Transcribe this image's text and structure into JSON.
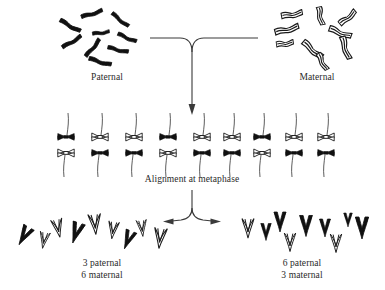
{
  "figure": {
    "title_visible": false,
    "background_color": "#ffffff",
    "ink_color": "#111111",
    "text_color": "#2a2a2a"
  },
  "labels": {
    "paternal": "Paternal",
    "maternal": "Maternal",
    "metaphase": "Alignment at metaphase",
    "daughter_left": "3 paternal\n6 maternal",
    "daughter_right": "6 paternal\n3 maternal"
  },
  "legend_semantics": {
    "solid_black": "paternal chromosome",
    "outlined_white": "maternal chromosome"
  },
  "chart_data": {
    "type": "diagram",
    "chromosome_pairs_total": 9,
    "parent_clusters": [
      {
        "name": "Paternal",
        "origin": "paternal",
        "style": "solid",
        "count": 9,
        "chromosomes": [
          {
            "cx": 92,
            "cy": 14,
            "angle": -18,
            "len": 22,
            "w": 5.2
          },
          {
            "cx": 120,
            "cy": 20,
            "angle": 38,
            "len": 21,
            "w": 5.0
          },
          {
            "cx": 70,
            "cy": 26,
            "angle": 28,
            "len": 23,
            "w": 5.4
          },
          {
            "cx": 101,
            "cy": 33,
            "angle": -8,
            "len": 17,
            "w": 4.6
          },
          {
            "cx": 127,
            "cy": 38,
            "angle": 22,
            "len": 20,
            "w": 5.0
          },
          {
            "cx": 72,
            "cy": 42,
            "angle": -32,
            "len": 22,
            "w": 5.2
          },
          {
            "cx": 93,
            "cy": 48,
            "angle": -52,
            "len": 22,
            "w": 5.2
          },
          {
            "cx": 118,
            "cy": 50,
            "angle": 12,
            "len": 21,
            "w": 5.0
          },
          {
            "cx": 100,
            "cy": 62,
            "angle": 15,
            "len": 23,
            "w": 5.4
          }
        ]
      },
      {
        "name": "Maternal",
        "origin": "maternal",
        "style": "outline",
        "count": 9,
        "chromosomes": [
          {
            "cx": 292,
            "cy": 15,
            "angle": -10,
            "len": 21,
            "w": 6.0
          },
          {
            "cx": 320,
            "cy": 16,
            "angle": 78,
            "len": 18,
            "w": 5.6
          },
          {
            "cx": 348,
            "cy": 18,
            "angle": -40,
            "len": 20,
            "w": 5.8
          },
          {
            "cx": 287,
            "cy": 30,
            "angle": -15,
            "len": 24,
            "w": 6.2
          },
          {
            "cx": 340,
            "cy": 33,
            "angle": 20,
            "len": 23,
            "w": 6.0
          },
          {
            "cx": 285,
            "cy": 44,
            "angle": -8,
            "len": 17,
            "w": 5.4
          },
          {
            "cx": 312,
            "cy": 50,
            "angle": 40,
            "len": 24,
            "w": 6.2
          },
          {
            "cx": 345,
            "cy": 48,
            "angle": 72,
            "len": 23,
            "w": 6.0
          },
          {
            "cx": 322,
            "cy": 62,
            "angle": 62,
            "len": 18,
            "w": 5.6
          }
        ]
      }
    ],
    "metaphase_plate": {
      "label": "Alignment at metaphase",
      "pair_count": 9,
      "note": "Each bivalent has one paternal and one maternal homolog; which side faces up is random.",
      "pairs": [
        {
          "index": 1,
          "x": 66,
          "top": "paternal",
          "bottom": "maternal"
        },
        {
          "index": 2,
          "x": 100,
          "top": "maternal",
          "bottom": "paternal"
        },
        {
          "index": 3,
          "x": 134,
          "top": "maternal",
          "bottom": "paternal"
        },
        {
          "index": 4,
          "x": 168,
          "top": "paternal",
          "bottom": "maternal"
        },
        {
          "index": 5,
          "x": 202,
          "top": "maternal",
          "bottom": "paternal"
        },
        {
          "index": 6,
          "x": 232,
          "top": "maternal",
          "bottom": "paternal"
        },
        {
          "index": 7,
          "x": 262,
          "top": "paternal",
          "bottom": "maternal"
        },
        {
          "index": 8,
          "x": 294,
          "top": "maternal",
          "bottom": "paternal"
        },
        {
          "index": 9,
          "x": 326,
          "top": "maternal",
          "bottom": "paternal"
        }
      ],
      "top_row_counts": {
        "paternal": 3,
        "maternal": 6
      },
      "bottom_row_counts": {
        "paternal": 6,
        "maternal": 3
      }
    },
    "daughter_cells": [
      {
        "side": "left",
        "label": "3 paternal\n6 maternal",
        "paternal_count": 3,
        "maternal_count": 6,
        "total": 9,
        "chromosomes": [
          {
            "cx": 24,
            "cy": 236,
            "angle": 30,
            "len": 20,
            "style": "solid"
          },
          {
            "cx": 44,
            "cy": 240,
            "angle": 10,
            "len": 16,
            "style": "outline"
          },
          {
            "cx": 58,
            "cy": 228,
            "angle": -12,
            "len": 18,
            "style": "outline"
          },
          {
            "cx": 76,
            "cy": 233,
            "angle": 18,
            "len": 21,
            "style": "solid"
          },
          {
            "cx": 95,
            "cy": 224,
            "angle": -5,
            "len": 20,
            "style": "outline"
          },
          {
            "cx": 113,
            "cy": 230,
            "angle": 8,
            "len": 17,
            "style": "outline"
          },
          {
            "cx": 128,
            "cy": 240,
            "angle": 22,
            "len": 19,
            "style": "solid"
          },
          {
            "cx": 142,
            "cy": 228,
            "angle": -6,
            "len": 16,
            "style": "outline"
          },
          {
            "cx": 160,
            "cy": 238,
            "angle": 6,
            "len": 20,
            "style": "outline"
          }
        ]
      },
      {
        "side": "right",
        "label": "6 paternal\n3 maternal",
        "paternal_count": 6,
        "maternal_count": 3,
        "total": 9,
        "chromosomes": [
          {
            "cx": 248,
            "cy": 228,
            "angle": 0,
            "len": 19,
            "style": "outline"
          },
          {
            "cx": 266,
            "cy": 232,
            "angle": 0,
            "len": 17,
            "style": "solid"
          },
          {
            "cx": 280,
            "cy": 222,
            "angle": 0,
            "len": 20,
            "style": "solid"
          },
          {
            "cx": 290,
            "cy": 242,
            "angle": 0,
            "len": 18,
            "style": "outline"
          },
          {
            "cx": 306,
            "cy": 226,
            "angle": 0,
            "len": 21,
            "style": "solid"
          },
          {
            "cx": 325,
            "cy": 228,
            "angle": 0,
            "len": 18,
            "style": "solid"
          },
          {
            "cx": 336,
            "cy": 243,
            "angle": 0,
            "len": 18,
            "style": "outline"
          },
          {
            "cx": 348,
            "cy": 220,
            "angle": 0,
            "len": 14,
            "style": "solid"
          },
          {
            "cx": 362,
            "cy": 228,
            "angle": 0,
            "len": 22,
            "style": "solid"
          }
        ]
      }
    ],
    "arrows": [
      {
        "name": "merge-arrow",
        "kind": "converging",
        "from": [
          "Paternal",
          "Maternal"
        ],
        "to": "Alignment at metaphase",
        "direction": "down"
      },
      {
        "name": "split-arrow",
        "kind": "diverging",
        "from": "Alignment at metaphase",
        "to": [
          "left daughter",
          "right daughter"
        ],
        "direction": "down-split"
      }
    ]
  }
}
